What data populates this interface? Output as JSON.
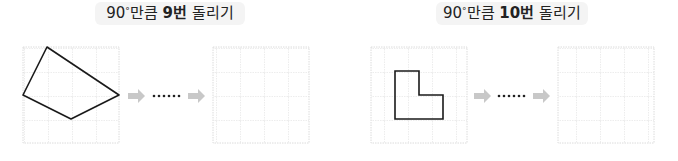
{
  "problems": [
    {
      "title": {
        "prefix": "90",
        "degree": "°",
        "mid": "만큼 ",
        "count": "9번",
        "suffix": " 돌리기"
      },
      "grid": {
        "rows": 4,
        "cols": 4
      },
      "shape_name": "quadrilateral",
      "shape_vertices": [
        [
          1,
          0
        ],
        [
          4,
          2
        ],
        [
          2,
          3
        ],
        [
          0,
          2
        ]
      ],
      "ellipsis": "……"
    },
    {
      "title": {
        "prefix": "90",
        "degree": "°",
        "mid": "만큼 ",
        "count": "10번",
        "suffix": " 돌리기"
      },
      "grid": {
        "rows": 4,
        "cols": 4
      },
      "shape_name": "L-shape",
      "shape_vertices": [
        [
          1,
          1
        ],
        [
          2,
          1
        ],
        [
          2,
          2
        ],
        [
          3,
          2
        ],
        [
          3,
          3
        ],
        [
          1,
          3
        ]
      ],
      "ellipsis": "……"
    }
  ],
  "colors": {
    "grid_line": "#d9d9d9",
    "shape_stroke": "#1a1a1a",
    "arrow": "#c8c8c8",
    "title_bg": "#f4f4f4",
    "dots": "#222222"
  }
}
